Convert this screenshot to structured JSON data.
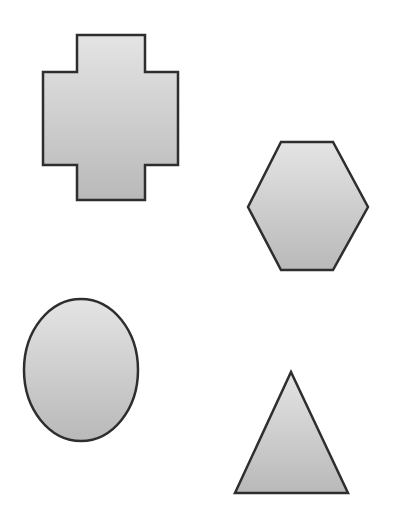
{
  "diagram": {
    "title": "",
    "background": "#ffffff",
    "style": {
      "fill_light": "#e4e4e4",
      "fill_dark": "#b9b9b9",
      "stroke": "#2e2e2e",
      "stroke_width": 2.5
    },
    "shapes": [
      {
        "id": "cross",
        "type": "cross",
        "label": "",
        "points": "77,35 145,35 145,72 178,72 178,165 145,165 145,200 77,200 77,165 43,165 43,72 77,72"
      },
      {
        "id": "hexagon",
        "type": "hexagon",
        "label": "",
        "points": "281,142 333,142 368,207 333,270 281,270 248,207"
      },
      {
        "id": "ellipse",
        "type": "ellipse",
        "label": "",
        "cx": 81,
        "cy": 370,
        "rx": 57,
        "ry": 71
      },
      {
        "id": "triangle",
        "type": "triangle",
        "label": "",
        "points": "291,372 348,493 235,493"
      }
    ]
  }
}
